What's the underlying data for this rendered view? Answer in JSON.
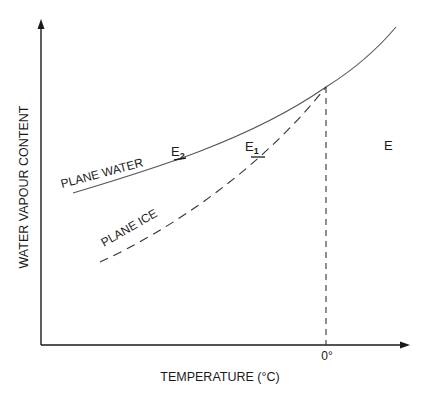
{
  "diagram": {
    "type": "saturation vapour curves",
    "axes": {
      "y_label": "WATER VAPOUR CONTENT",
      "x_label": "TEMPERATURE (°C)",
      "x_tick": "0°"
    },
    "curves": {
      "water": {
        "label": "PLANE WATER",
        "style": "solid"
      },
      "ice": {
        "label": "PLANE ICE",
        "style": "dashed"
      }
    },
    "points": {
      "e2": {
        "letter": "E",
        "subscript": "2"
      },
      "e1": {
        "letter": "E",
        "subscript": "1"
      },
      "e": {
        "letter": "E"
      }
    },
    "colors": {
      "line": "#1a1a1a",
      "curve": "#555555",
      "background": "#ffffff"
    }
  }
}
